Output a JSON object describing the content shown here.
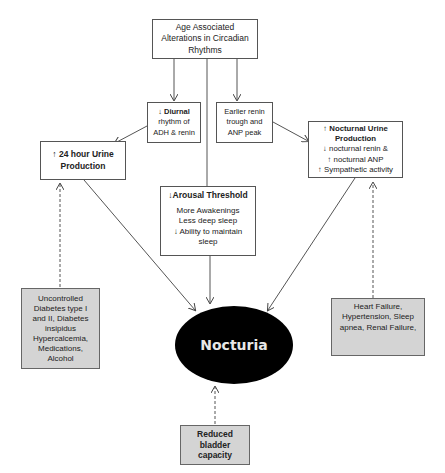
{
  "title_box": {
    "lines": [
      "Age Associated",
      "Alterations in Circadian",
      "Rhythms"
    ]
  },
  "diurnal_box": {
    "lines": [
      "↓ Diurnal",
      "rhythm of",
      "ADH & renin"
    ]
  },
  "renin_box": {
    "lines": [
      "Earlier renin",
      "trough and",
      "ANP peak"
    ]
  },
  "urine24_box": {
    "lines": [
      "↑ 24 hour Urine",
      "Production"
    ]
  },
  "nocturnal_box": {
    "heading": [
      "↑ Nocturnal Urine",
      "Production"
    ],
    "lines": [
      "↓ nocturnal renin &",
      "↑ nocturnal ANP",
      "↑ Sympathetic activity"
    ]
  },
  "arousal_box": {
    "heading": "↓Arousal Threshold",
    "lines": [
      "More Awakenings",
      "Less deep sleep",
      "↓ Ability to maintain",
      "sleep"
    ]
  },
  "left_cause_box": {
    "lines": [
      "Uncontrolled",
      "Diabetes type I",
      "and II, Diabetes",
      "insipidus",
      "Hypercalcemia,",
      "Medications,",
      "Alcohol"
    ]
  },
  "right_cause_box": {
    "lines": [
      "Heart Failure,",
      "Hypertension, Sleep",
      "apnea, Renal Failure,"
    ]
  },
  "center": {
    "label": "Nocturia"
  },
  "bottom_box": {
    "lines": [
      "Reduced",
      "bladder",
      "capacity"
    ]
  },
  "colors": {
    "box_border": "#555555",
    "grey_fill": "#d4d4d4",
    "ellipse_fill": "#000000",
    "ellipse_text": "#e8e8e8"
  }
}
